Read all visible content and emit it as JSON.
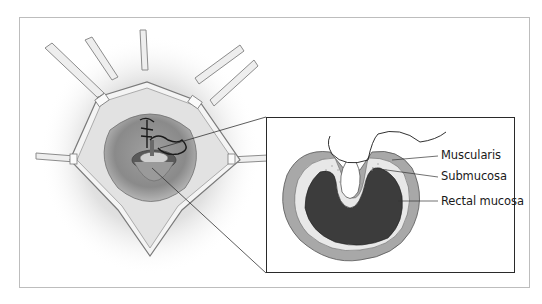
{
  "figure": {
    "left_panel": "Operative view of anal canal held open by retractors, with suture placed in rectal wall",
    "inset": {
      "labels": [
        {
          "id": "muscularis",
          "text": "Muscularis"
        },
        {
          "id": "submucosa",
          "text": "Submucosa"
        },
        {
          "id": "rectal_mucosa",
          "text": "Rectal mucosa"
        }
      ]
    }
  },
  "colors": {
    "muscularis": "#a8a8a8",
    "submucosa": "#e6e6e6",
    "mucosa": "#3c3c3c",
    "frame": "#bdbdbd",
    "inset_border": "#2a2a2a"
  }
}
